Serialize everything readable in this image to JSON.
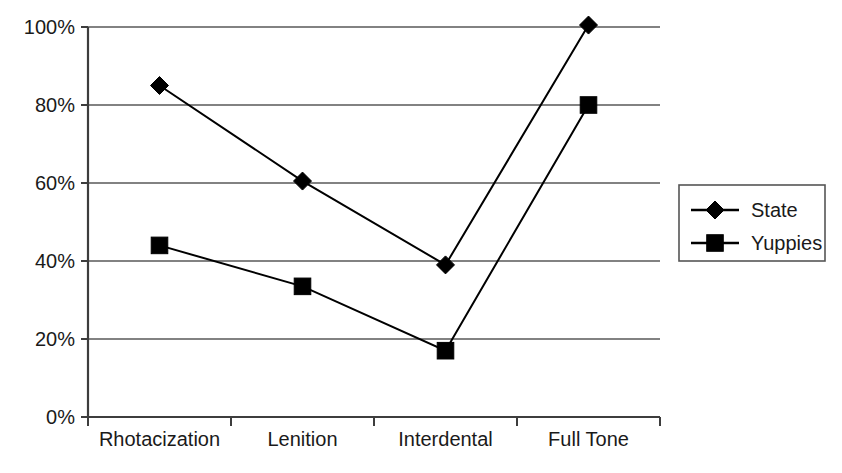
{
  "chart_data": {
    "type": "line",
    "title": "",
    "subtitle": "",
    "xlabel": "",
    "ylabel": "",
    "categories": [
      "Rhotacization",
      "Lenition",
      "Interdental",
      "Full Tone"
    ],
    "series": [
      {
        "name": "State",
        "marker": "diamond",
        "values": [
          85,
          60.5,
          39,
          100.5
        ]
      },
      {
        "name": "Yuppies",
        "marker": "square",
        "values": [
          44,
          33.5,
          17,
          80
        ]
      }
    ],
    "ylim": [
      0,
      100
    ],
    "y_ticks": [
      0,
      20,
      40,
      60,
      80,
      100
    ],
    "y_tick_labels": [
      "0%",
      "20%",
      "40%",
      "60%",
      "80%",
      "100%"
    ],
    "grid": true,
    "grid_axis": "y",
    "legend_position": "right",
    "legend_entries": [
      "State",
      "Yuppies"
    ],
    "colors": {
      "series_line": "#000000",
      "marker": "#000000",
      "gridline": "#595959",
      "axis": "#3d3d3d",
      "text": "#1a1a1a",
      "background": "#ffffff"
    }
  },
  "caption": {
    "text": ""
  }
}
